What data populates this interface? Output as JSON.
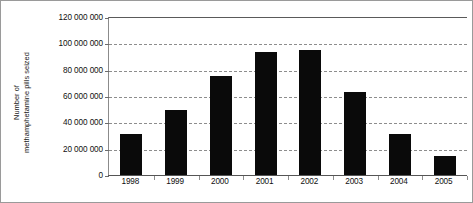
{
  "chart_data": {
    "type": "bar",
    "title": "",
    "xlabel": "",
    "ylabel": "Number of methamphetamine pills seized",
    "ylabel_lines": [
      "Number of",
      "methamphetamine pills seized"
    ],
    "categories": [
      "1998",
      "1999",
      "2000",
      "2001",
      "2002",
      "2003",
      "2004",
      "2005"
    ],
    "values": [
      32000000,
      50000000,
      76000000,
      94000000,
      96000000,
      64000000,
      32000000,
      15000000
    ],
    "ylim": [
      0,
      120000000
    ],
    "ytick_values": [
      0,
      20000000,
      40000000,
      60000000,
      80000000,
      100000000,
      120000000
    ],
    "ytick_labels": [
      "0",
      "20 000 000",
      "40 000 000",
      "60 000 000",
      "80 000 000",
      "100 000 000",
      "120 000 000"
    ],
    "grid": true,
    "grid_style": "dashed-horizontal",
    "legend": null,
    "bar_color": "#0a0a0a",
    "gridline_color": "#8d8d8d",
    "axis_color": "#5a5a5a",
    "background_color": "#ffffff",
    "border_color": "#9a9a9a"
  }
}
